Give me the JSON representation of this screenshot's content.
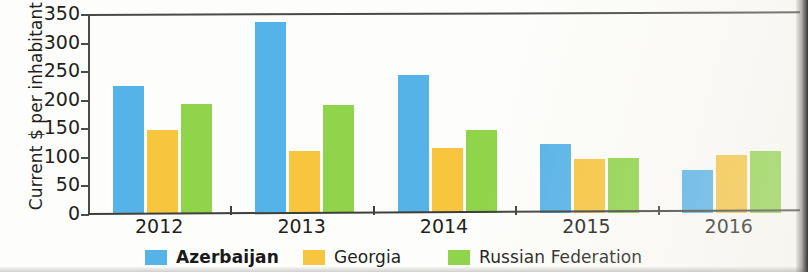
{
  "chart_data": {
    "type": "bar",
    "title": "",
    "xlabel": "",
    "ylabel": "Current $ per inhabitant",
    "categories": [
      "2012",
      "2013",
      "2014",
      "2015",
      "2016"
    ],
    "series": [
      {
        "name": "Azerbaijan",
        "color": "#55b3e8",
        "values": [
          223,
          334,
          241,
          120,
          75
        ]
      },
      {
        "name": "Georgia",
        "color": "#f8c53f",
        "values": [
          145,
          108,
          114,
          95,
          101
        ]
      },
      {
        "name": "Russian Federation",
        "color": "#8fd44a",
        "values": [
          190,
          189,
          146,
          97,
          109
        ]
      }
    ],
    "ylim": [
      0,
      350
    ],
    "yticks": [
      0,
      50,
      100,
      150,
      200,
      250,
      300,
      350
    ],
    "ytick_labels": [
      "0",
      "50",
      "100",
      "150",
      "200",
      "250",
      "300",
      "350"
    ],
    "grid": false,
    "legend_position": "bottom"
  },
  "legend": {
    "items": [
      {
        "label": "Azerbaijan",
        "color": "#55b3e8",
        "bold": true
      },
      {
        "label": "Georgia",
        "color": "#f8c53f",
        "bold": false
      },
      {
        "label": "Russian Federation",
        "color": "#8fd44a",
        "bold": false
      }
    ]
  }
}
